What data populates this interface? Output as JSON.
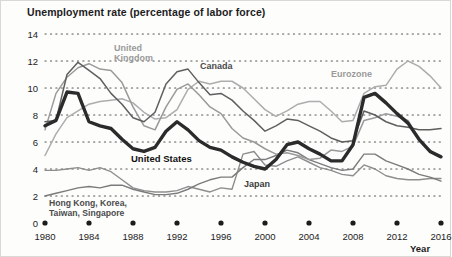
{
  "chart_title": "Unemployment rate (percentage of labor force)",
  "axis": {
    "x_name": "Year",
    "y_ticks": [
      "14",
      "12",
      "10",
      "8",
      "6",
      "4",
      "2",
      "0"
    ],
    "x_ticks": [
      "1980",
      "1984",
      "1988",
      "1992",
      "1996",
      "2000",
      "2004",
      "2008",
      "2012",
      "2016"
    ]
  },
  "series_labels": {
    "united_kingdom": "United\nKingdom",
    "united_kingdom_l1": "United",
    "united_kingdom_l2": "Kingdom",
    "canada": "Canada",
    "eurozone": "Eurozone",
    "united_states": "United States",
    "japan": "Japan",
    "tigers_l1": "Hong Kong, Korea,",
    "tigers_l2": "Taiwan, Singapore"
  },
  "colors": {
    "united_states": "#2b2b2b",
    "united_kingdom": "#9a9a9a",
    "canada": "#5f5f5f",
    "eurozone": "#adadad",
    "japan": "#7b7b7b",
    "tigers": "#8e8e8e",
    "gridline": "#575757",
    "background": "#fdfdfc",
    "text": "#1c1c1c"
  },
  "chart_data": {
    "type": "line",
    "title": "Unemployment rate (percentage of labor force)",
    "xlabel": "Year",
    "ylabel": "Unemployment rate (percentage of labor force)",
    "xlim": [
      1980,
      2016
    ],
    "ylim": [
      0,
      14
    ],
    "grid": "horizontal-dotted",
    "legend": "inline-annotations",
    "x": [
      1980,
      1981,
      1982,
      1983,
      1984,
      1985,
      1986,
      1987,
      1988,
      1989,
      1990,
      1991,
      1992,
      1993,
      1994,
      1995,
      1996,
      1997,
      1998,
      1999,
      2000,
      2001,
      2002,
      2003,
      2004,
      2005,
      2006,
      2007,
      2008,
      2009,
      2010,
      2011,
      2012,
      2013,
      2014,
      2015,
      2016
    ],
    "series": [
      {
        "name": "United States",
        "key": "united_states",
        "emphasis": "bold",
        "values": [
          7.2,
          7.6,
          9.7,
          9.6,
          7.5,
          7.2,
          7.0,
          6.2,
          5.5,
          5.3,
          5.6,
          6.8,
          7.5,
          6.9,
          6.1,
          5.6,
          5.4,
          4.9,
          4.5,
          4.2,
          4.0,
          4.7,
          5.8,
          6.0,
          5.5,
          5.1,
          4.6,
          4.6,
          5.8,
          9.3,
          9.6,
          8.9,
          8.1,
          7.4,
          6.2,
          5.3,
          4.9
        ]
      },
      {
        "name": "United Kingdom",
        "key": "united_kingdom",
        "emphasis": "normal",
        "values": [
          6.9,
          9.6,
          10.8,
          11.5,
          11.8,
          11.4,
          11.3,
          10.4,
          8.6,
          7.2,
          6.9,
          8.6,
          9.9,
          10.3,
          9.5,
          8.6,
          8.1,
          7.0,
          6.3,
          6.0,
          5.5,
          5.1,
          5.2,
          5.0,
          4.7,
          4.8,
          5.4,
          5.3,
          5.7,
          7.6,
          7.8,
          8.1,
          7.9,
          7.6,
          6.2,
          5.4,
          4.9
        ]
      },
      {
        "name": "Canada",
        "key": "canada",
        "emphasis": "normal",
        "values": [
          7.5,
          7.6,
          11.0,
          11.9,
          11.3,
          10.7,
          9.6,
          8.8,
          7.8,
          7.5,
          8.2,
          10.3,
          11.2,
          11.4,
          10.4,
          9.5,
          9.6,
          9.1,
          8.3,
          7.6,
          6.8,
          7.2,
          7.7,
          7.6,
          7.2,
          6.8,
          6.3,
          6.0,
          6.1,
          8.3,
          8.0,
          7.5,
          7.2,
          7.1,
          6.9,
          6.9,
          7.0
        ]
      },
      {
        "name": "Eurozone",
        "key": "eurozone",
        "emphasis": "normal",
        "values": [
          5.0,
          6.6,
          7.8,
          8.3,
          8.8,
          9.0,
          9.1,
          9.2,
          8.9,
          8.2,
          7.7,
          7.8,
          8.4,
          9.9,
          10.5,
          10.3,
          10.5,
          10.5,
          10.0,
          9.2,
          8.4,
          7.9,
          8.3,
          8.8,
          9.0,
          9.0,
          8.3,
          7.5,
          7.6,
          9.6,
          10.1,
          10.2,
          11.4,
          12.0,
          11.6,
          10.9,
          10.0
        ]
      },
      {
        "name": "Japan",
        "key": "japan",
        "emphasis": "normal",
        "values": [
          2.0,
          2.2,
          2.4,
          2.6,
          2.7,
          2.6,
          2.8,
          2.8,
          2.5,
          2.3,
          2.1,
          2.1,
          2.2,
          2.5,
          2.9,
          3.2,
          3.4,
          3.4,
          4.1,
          4.7,
          4.7,
          5.0,
          5.4,
          5.2,
          4.7,
          4.4,
          4.1,
          3.9,
          4.0,
          5.1,
          5.1,
          4.6,
          4.3,
          4.0,
          3.6,
          3.4,
          3.1
        ]
      },
      {
        "name": "Hong Kong, Korea, Taiwan, Singapore",
        "key": "tigers",
        "emphasis": "normal",
        "values": [
          3.9,
          3.9,
          4.0,
          4.1,
          3.9,
          4.1,
          3.8,
          3.2,
          2.6,
          2.4,
          2.3,
          2.3,
          2.4,
          2.7,
          2.5,
          2.3,
          2.6,
          2.5,
          5.1,
          5.3,
          4.3,
          4.2,
          4.6,
          4.9,
          4.5,
          4.1,
          3.9,
          3.6,
          3.5,
          4.3,
          4.0,
          3.5,
          3.3,
          3.2,
          3.2,
          3.3,
          3.3
        ]
      }
    ]
  }
}
